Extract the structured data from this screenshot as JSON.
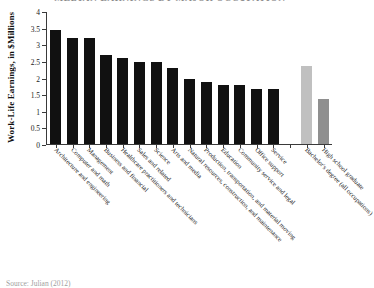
{
  "chart_data": {
    "type": "bar",
    "title": "MEDIAN EARNINGS BY MAJOR OCCUPATION",
    "xlabel": "",
    "ylabel": "Work-Life Earnings, in $Millions",
    "ylim": [
      0,
      4
    ],
    "ytick_labels": [
      "0",
      "0.5",
      "1",
      "1.5",
      "2",
      "2.5",
      "3",
      "3.5",
      "4"
    ],
    "ytick_values": [
      0,
      0.5,
      1,
      1.5,
      2,
      2.5,
      3,
      3.5,
      4
    ],
    "grid": false,
    "legend": "none",
    "categories": [
      "Architecture and engineering",
      "Computer and math",
      "Management",
      "Business and financial",
      "Healthcare practitioners and technicians",
      "Sales and related",
      "Science",
      "Arts and media",
      "Natural resources, construction, and maintenance",
      "Production, transportation, and material moving",
      "Education",
      "Community service and legal",
      "Office support",
      "Service",
      "",
      "Bachelor's degree (all occupations)",
      "High school graduate"
    ],
    "values": [
      3.42,
      3.19,
      3.19,
      2.67,
      2.59,
      2.47,
      2.47,
      2.28,
      1.96,
      1.86,
      1.77,
      1.77,
      1.65,
      1.65,
      null,
      2.35,
      1.35
    ],
    "colors": [
      "#111111",
      "#111111",
      "#111111",
      "#111111",
      "#111111",
      "#111111",
      "#111111",
      "#111111",
      "#111111",
      "#111111",
      "#111111",
      "#111111",
      "#111111",
      "#111111",
      "none",
      "#c0c0c0",
      "#8f8f8f"
    ]
  },
  "source": {
    "note": "Source: Julian (2012)"
  }
}
